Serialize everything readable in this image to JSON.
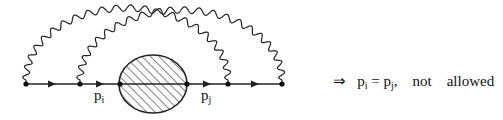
{
  "diagram": {
    "type": "feynman-diagram",
    "fermion_line": {
      "vertices_x": [
        26,
        80,
        120,
        187,
        228,
        282
      ],
      "y": 84,
      "arrows_x": [
        52,
        100,
        207,
        255
      ]
    },
    "blob": {
      "cx": 153,
      "cy": 84,
      "rx": 34,
      "ry": 29,
      "fill": "hatched"
    },
    "photons": [
      {
        "from_x": 26,
        "to_x": 228,
        "peak_y": 8
      },
      {
        "from_x": 80,
        "to_x": 282,
        "peak_y": 10
      }
    ],
    "labels": {
      "pi_base": "p",
      "pi_sub": "i",
      "pj_base": "p",
      "pj_sub": "j"
    }
  },
  "caption": {
    "arrow": "⇒",
    "lhs_base": "p",
    "lhs_sub": "i",
    "equals": " = ",
    "rhs_base": "p",
    "rhs_sub": "j",
    "comma": ",",
    "not": "not",
    "allowed": "allowed"
  }
}
